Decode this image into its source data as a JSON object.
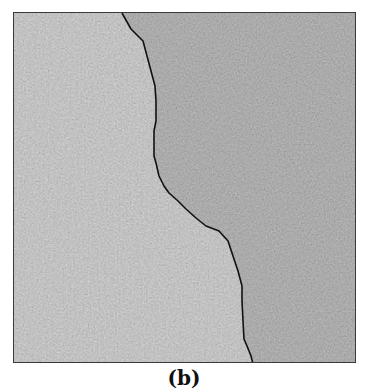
{
  "figure": {
    "caption": "(b)",
    "panel": {
      "description": "Noisy grayscale texture split into two regions by a dark segmentation boundary",
      "regions": [
        {
          "name": "left-region",
          "tone": "lighter gray",
          "color": "#939393"
        },
        {
          "name": "right-region",
          "tone": "darker gray",
          "color": "#707070"
        }
      ],
      "boundary_color": "#111111",
      "border_color": "#3a3a3a"
    }
  }
}
